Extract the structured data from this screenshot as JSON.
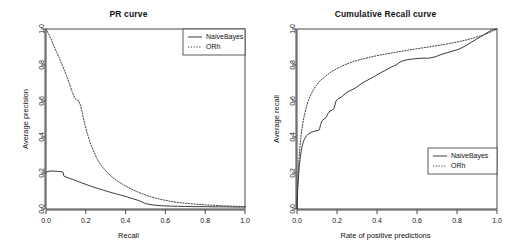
{
  "figure": {
    "width": 514,
    "height": 251,
    "background": "#ffffff",
    "ink_color": "#333333"
  },
  "chart_data": [
    {
      "type": "line",
      "title": "PR curve",
      "xlabel": "Recall",
      "ylabel": "Average precision",
      "xlim": [
        0.0,
        1.0
      ],
      "ylim": [
        0.0,
        1.0
      ],
      "xticks": [
        "0.0",
        "0.2",
        "0.4",
        "0.6",
        "0.8",
        "1.0"
      ],
      "xtick_values": [
        0.0,
        0.2,
        0.4,
        0.6,
        0.8,
        1.0
      ],
      "yticks": [
        "0.0",
        "0.2",
        "0.4",
        "0.6",
        "0.8",
        "1.0"
      ],
      "ytick_values": [
        0.0,
        0.2,
        0.4,
        0.6,
        0.8,
        1.0
      ],
      "grid": false,
      "legend_position": "top-right",
      "legend": [
        "NaiveBayes",
        "ORh"
      ],
      "series": [
        {
          "name": "NaiveBayes",
          "style": "solid",
          "color": "#333333",
          "x": [
            0.0,
            0.01,
            0.02,
            0.03,
            0.05,
            0.07,
            0.085,
            0.09,
            0.1,
            0.12,
            0.14,
            0.16,
            0.18,
            0.2,
            0.23,
            0.26,
            0.29,
            0.32,
            0.35,
            0.38,
            0.41,
            0.44,
            0.47,
            0.5,
            0.54,
            0.58,
            0.62,
            0.66,
            0.7,
            0.75,
            0.8,
            0.85,
            0.9,
            0.95,
            1.0
          ],
          "y": [
            0.205,
            0.208,
            0.21,
            0.211,
            0.21,
            0.208,
            0.206,
            0.182,
            0.178,
            0.17,
            0.162,
            0.153,
            0.145,
            0.137,
            0.125,
            0.114,
            0.104,
            0.094,
            0.085,
            0.076,
            0.066,
            0.056,
            0.046,
            0.03,
            0.022,
            0.018,
            0.016,
            0.015,
            0.014,
            0.013,
            0.013,
            0.012,
            0.012,
            0.011,
            0.011
          ]
        },
        {
          "name": "ORh",
          "style": "dotted",
          "color": "#333333",
          "x": [
            0.0,
            0.012,
            0.025,
            0.04,
            0.055,
            0.07,
            0.085,
            0.1,
            0.115,
            0.13,
            0.145,
            0.155,
            0.165,
            0.175,
            0.185,
            0.195,
            0.21,
            0.225,
            0.24,
            0.26,
            0.28,
            0.3,
            0.33,
            0.36,
            0.39,
            0.42,
            0.45,
            0.48,
            0.52,
            0.56,
            0.6,
            0.64,
            0.68,
            0.72,
            0.76,
            0.8,
            0.85,
            0.9,
            0.95,
            1.0
          ],
          "y": [
            1.0,
            0.975,
            0.945,
            0.905,
            0.868,
            0.83,
            0.79,
            0.75,
            0.705,
            0.655,
            0.615,
            0.606,
            0.6,
            0.57,
            0.52,
            0.47,
            0.41,
            0.36,
            0.318,
            0.272,
            0.238,
            0.212,
            0.18,
            0.155,
            0.134,
            0.116,
            0.1,
            0.086,
            0.07,
            0.058,
            0.048,
            0.04,
            0.034,
            0.03,
            0.026,
            0.023,
            0.02,
            0.017,
            0.015,
            0.013
          ]
        }
      ]
    },
    {
      "type": "line",
      "title": "Cumulative Recall curve",
      "xlabel": "Rate of positive predictions",
      "ylabel": "Average recall",
      "xlim": [
        0.0,
        1.0
      ],
      "ylim": [
        0.0,
        1.0
      ],
      "xticks": [
        "0.0",
        "0.2",
        "0.4",
        "0.6",
        "0.8",
        "1.0"
      ],
      "xtick_values": [
        0.0,
        0.2,
        0.4,
        0.6,
        0.8,
        1.0
      ],
      "yticks": [
        "0.0",
        "0.2",
        "0.4",
        "0.6",
        "0.8",
        "1.0"
      ],
      "ytick_values": [
        0.0,
        0.2,
        0.4,
        0.6,
        0.8,
        1.0
      ],
      "grid": false,
      "legend_position": "bottom-right",
      "legend": [
        "NaiveBayes",
        "ORh"
      ],
      "series": [
        {
          "name": "NaiveBayes",
          "style": "solid",
          "color": "#333333",
          "x": [
            0.0,
            0.002,
            0.004,
            0.008,
            0.012,
            0.018,
            0.024,
            0.03,
            0.038,
            0.046,
            0.055,
            0.065,
            0.075,
            0.085,
            0.095,
            0.105,
            0.112,
            0.118,
            0.125,
            0.135,
            0.145,
            0.155,
            0.165,
            0.175,
            0.185,
            0.195,
            0.205,
            0.215,
            0.225,
            0.24,
            0.255,
            0.27,
            0.285,
            0.3,
            0.32,
            0.34,
            0.36,
            0.38,
            0.4,
            0.42,
            0.445,
            0.47,
            0.495,
            0.52,
            0.545,
            0.57,
            0.6,
            0.63,
            0.66,
            0.69,
            0.72,
            0.75,
            0.78,
            0.81,
            0.84,
            0.87,
            0.9,
            0.93,
            0.955,
            0.975,
            1.0
          ],
          "y": [
            0.0,
            0.055,
            0.12,
            0.185,
            0.245,
            0.3,
            0.34,
            0.368,
            0.39,
            0.405,
            0.415,
            0.422,
            0.428,
            0.432,
            0.434,
            0.436,
            0.44,
            0.47,
            0.49,
            0.5,
            0.508,
            0.53,
            0.545,
            0.548,
            0.56,
            0.6,
            0.612,
            0.618,
            0.625,
            0.64,
            0.652,
            0.66,
            0.668,
            0.678,
            0.695,
            0.708,
            0.72,
            0.732,
            0.745,
            0.758,
            0.772,
            0.788,
            0.8,
            0.82,
            0.828,
            0.832,
            0.836,
            0.838,
            0.838,
            0.845,
            0.858,
            0.868,
            0.878,
            0.888,
            0.905,
            0.925,
            0.945,
            0.965,
            0.982,
            0.995,
            1.0
          ]
        },
        {
          "name": "ORh",
          "style": "dotted",
          "color": "#333333",
          "x": [
            0.0,
            0.002,
            0.005,
            0.009,
            0.014,
            0.02,
            0.027,
            0.035,
            0.045,
            0.055,
            0.068,
            0.082,
            0.096,
            0.11,
            0.125,
            0.14,
            0.16,
            0.18,
            0.2,
            0.225,
            0.25,
            0.28,
            0.31,
            0.345,
            0.38,
            0.415,
            0.45,
            0.49,
            0.53,
            0.57,
            0.61,
            0.65,
            0.69,
            0.73,
            0.77,
            0.81,
            0.85,
            0.89,
            0.93,
            0.965,
            1.0
          ],
          "y": [
            0.0,
            0.09,
            0.18,
            0.265,
            0.34,
            0.405,
            0.462,
            0.512,
            0.56,
            0.598,
            0.632,
            0.662,
            0.686,
            0.706,
            0.722,
            0.736,
            0.754,
            0.768,
            0.78,
            0.794,
            0.806,
            0.818,
            0.828,
            0.838,
            0.847,
            0.855,
            0.862,
            0.87,
            0.878,
            0.885,
            0.892,
            0.899,
            0.906,
            0.913,
            0.921,
            0.93,
            0.94,
            0.952,
            0.966,
            0.982,
            1.0
          ]
        }
      ]
    }
  ]
}
